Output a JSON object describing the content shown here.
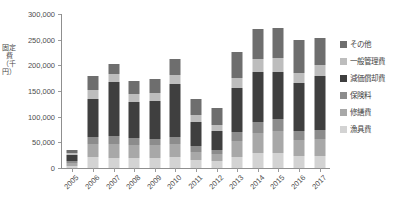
{
  "chart_data": {
    "type": "bar",
    "stacked": true,
    "title": "",
    "xlabel": "",
    "ylabel": "固定費（千円）",
    "ylim": [
      0,
      300000
    ],
    "ytick_step": 50000,
    "ytick_labels": [
      "300,000",
      "250,000",
      "200,000",
      "150,000",
      "100,000",
      "50,000",
      "0"
    ],
    "ytick_values": [
      300000,
      250000,
      200000,
      150000,
      100000,
      50000,
      0
    ],
    "grid": false,
    "legend_position": "right",
    "categories": [
      "2005",
      "2006",
      "2007",
      "2008",
      "2009",
      "2010",
      "2011",
      "2012",
      "2013",
      "2014",
      "2015",
      "2016",
      "2017"
    ],
    "series": [
      {
        "name": "漁具費",
        "color": "#d3d3d3",
        "values": [
          4000,
          21000,
          20000,
          19000,
          20000,
          21000,
          16000,
          13000,
          22000,
          29000,
          30000,
          23000,
          24000
        ]
      },
      {
        "name": "修繕費",
        "color": "#a8a8a8",
        "values": [
          6000,
          25000,
          27000,
          25000,
          24000,
          26000,
          16000,
          14000,
          31000,
          40000,
          43000,
          32000,
          33000
        ]
      },
      {
        "name": "保険料",
        "color": "#8c8c8c",
        "values": [
          3000,
          14000,
          15000,
          14000,
          13000,
          14000,
          10000,
          9000,
          17000,
          21000,
          23000,
          18000,
          18000
        ]
      },
      {
        "name": "減価償却費",
        "color": "#3f3f3f",
        "values": [
          13000,
          75000,
          105000,
          70000,
          73000,
          103000,
          48000,
          36000,
          85000,
          97000,
          92000,
          92000,
          105000
        ]
      },
      {
        "name": "一般管理費",
        "color": "#bdbdbd",
        "values": [
          4000,
          18000,
          16000,
          16000,
          16000,
          17000,
          13000,
          11000,
          20000,
          25000,
          26000,
          21000,
          21000
        ]
      },
      {
        "name": "その他",
        "color": "#6e6e6e",
        "values": [
          5000,
          26000,
          20000,
          26000,
          28000,
          32000,
          31000,
          34000,
          52000,
          59000,
          58000,
          63000,
          53000
        ]
      }
    ],
    "totals": [
      35000,
      179000,
      203000,
      170000,
      174000,
      213000,
      134000,
      117000,
      227000,
      271000,
      272000,
      249000,
      254000
    ]
  },
  "legend": {
    "items": [
      {
        "label": "その他",
        "color": "#6e6e6e"
      },
      {
        "label": "一般管理費",
        "color": "#bdbdbd"
      },
      {
        "label": "減価償却費",
        "color": "#3f3f3f"
      },
      {
        "label": "保険料",
        "color": "#8c8c8c"
      },
      {
        "label": "修繕費",
        "color": "#a8a8a8"
      },
      {
        "label": "漁具費",
        "color": "#d3d3d3"
      }
    ]
  },
  "axis": {
    "y_title": "固定費（千円）"
  }
}
